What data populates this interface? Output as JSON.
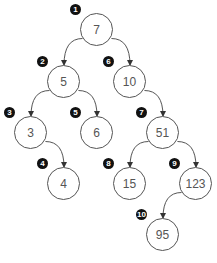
{
  "diagram": {
    "nodes": [
      {
        "id": "n1",
        "value": "7",
        "order": "1",
        "x": 97,
        "y": 30
      },
      {
        "id": "n2",
        "value": "5",
        "order": "2",
        "x": 64,
        "y": 82
      },
      {
        "id": "n3",
        "value": "3",
        "order": "3",
        "x": 31,
        "y": 133
      },
      {
        "id": "n4",
        "value": "4",
        "order": "4",
        "x": 64,
        "y": 184
      },
      {
        "id": "n5",
        "value": "6",
        "order": "5",
        "x": 97,
        "y": 133
      },
      {
        "id": "n6",
        "value": "10",
        "order": "6",
        "x": 130,
        "y": 82
      },
      {
        "id": "n7",
        "value": "51",
        "order": "7",
        "x": 163,
        "y": 133
      },
      {
        "id": "n8",
        "value": "15",
        "order": "8",
        "x": 130,
        "y": 184
      },
      {
        "id": "n9",
        "value": "123",
        "order": "9",
        "x": 196,
        "y": 184
      },
      {
        "id": "n10",
        "value": "95",
        "order": "10",
        "x": 163,
        "y": 235
      }
    ],
    "edges": [
      [
        "n1",
        "n2"
      ],
      [
        "n1",
        "n6"
      ],
      [
        "n2",
        "n3"
      ],
      [
        "n2",
        "n5"
      ],
      [
        "n3",
        "n4"
      ],
      [
        "n6",
        "n7"
      ],
      [
        "n7",
        "n8"
      ],
      [
        "n7",
        "n9"
      ],
      [
        "n9",
        "n10"
      ]
    ],
    "colors": {
      "stroke": "#555555",
      "badge": "#111111",
      "text": "#555555"
    }
  }
}
